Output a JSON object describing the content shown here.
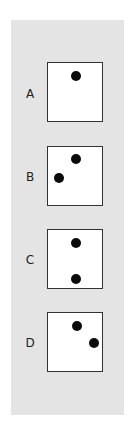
{
  "options": [
    {
      "label": "A",
      "box_top": 62,
      "label_top": 87,
      "dots": [
        [
          28,
          13
        ]
      ]
    },
    {
      "label": "B",
      "box_top": 146,
      "label_top": 170,
      "dots": [
        [
          28,
          12
        ],
        [
          11,
          31
        ]
      ]
    },
    {
      "label": "C",
      "box_top": 229,
      "label_top": 253,
      "dots": [
        [
          28,
          13
        ],
        [
          28,
          49
        ]
      ]
    },
    {
      "label": "D",
      "box_top": 312,
      "label_top": 336,
      "dots": [
        [
          29,
          13
        ],
        [
          46,
          30
        ]
      ]
    }
  ],
  "colors": {
    "panel": "#e4e4e4",
    "box": "#ffffff",
    "dot": "#0a0a0a",
    "border": "#333333"
  }
}
